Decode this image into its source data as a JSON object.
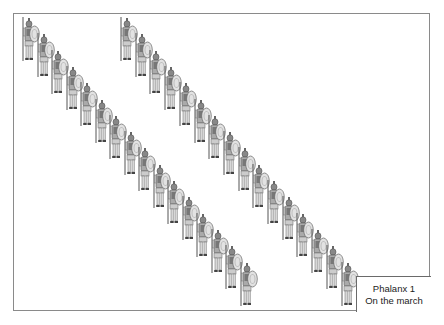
{
  "caption": {
    "line1": "Phalanx 1",
    "line2": "On the march"
  },
  "figure": {
    "files": [
      {
        "name": "left-file",
        "count": 16,
        "start": [
          20,
          17
        ],
        "step": [
          14.5,
          16.3
        ]
      },
      {
        "name": "right-file",
        "count": 16,
        "start": [
          118,
          17
        ],
        "step": [
          14.7,
          16.3
        ]
      }
    ],
    "colors": {
      "frame": "#8a8a8a",
      "ink": "#555555",
      "shield": "#d8d8d8",
      "body": "#9a9a9a"
    }
  }
}
